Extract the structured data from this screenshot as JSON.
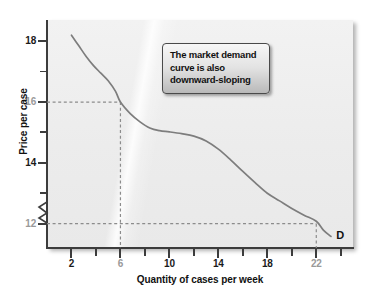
{
  "chart_data": {
    "type": "line",
    "title": "",
    "xlabel": "Quantity of cases per week",
    "ylabel": "Price per case",
    "xlim": [
      0,
      25
    ],
    "ylim": [
      11.2,
      18.7
    ],
    "grid": false,
    "legend": "none",
    "y_axis_break": true,
    "series": [
      {
        "name": "D",
        "label": "D",
        "color": "#7d7d7d",
        "x": [
          2.0,
          2.6,
          3.2,
          3.8,
          4.4,
          5.0,
          5.6,
          6.0,
          6.8,
          7.6,
          8.4,
          9.2,
          10.0,
          11.0,
          12.0,
          13.0,
          14.0,
          15.0,
          16.0,
          17.0,
          18.0,
          19.0,
          20.0,
          21.0,
          22.0,
          22.6,
          23.2
        ],
        "y": [
          18.2,
          17.85,
          17.5,
          17.2,
          16.95,
          16.7,
          16.35,
          16.0,
          15.62,
          15.35,
          15.15,
          15.06,
          15.02,
          14.96,
          14.88,
          14.72,
          14.45,
          14.1,
          13.72,
          13.35,
          13.0,
          12.75,
          12.5,
          12.28,
          12.08,
          11.78,
          11.58
        ]
      }
    ],
    "x_ticks_major": [
      2,
      6,
      10,
      14,
      18,
      22
    ],
    "x_ticks_minor": [
      4,
      8,
      12,
      16,
      20,
      24
    ],
    "x_tick_labels": [
      {
        "value": 2,
        "text": "2",
        "muted": false
      },
      {
        "value": 6,
        "text": "6",
        "muted": true
      },
      {
        "value": 10,
        "text": "10",
        "muted": false
      },
      {
        "value": 14,
        "text": "14",
        "muted": false
      },
      {
        "value": 18,
        "text": "18",
        "muted": false
      },
      {
        "value": 22,
        "text": "22",
        "muted": true
      }
    ],
    "y_ticks_major": [
      12,
      13,
      14,
      15,
      16,
      17,
      18
    ],
    "y_tick_labels": [
      {
        "value": 18,
        "text": "18",
        "muted": false
      },
      {
        "value": 16,
        "text": "16",
        "muted": true
      },
      {
        "value": 14,
        "text": "14",
        "muted": false
      },
      {
        "value": 12,
        "text": "12",
        "muted": true
      }
    ],
    "guide_lines": [
      {
        "name": "guide-6-16",
        "x": 6,
        "y": 16,
        "style": "dashed",
        "color": "#8c8c8c"
      },
      {
        "name": "guide-22-12",
        "x": 22,
        "y": 12,
        "style": "dashed",
        "color": "#8c8c8c"
      }
    ],
    "annotations": [
      {
        "name": "market-demand-callout",
        "lines": [
          "The market demand",
          "curve is also",
          "downward-sloping"
        ]
      },
      {
        "name": "curve-label",
        "text": "D",
        "x": 23.8,
        "y": 11.6
      }
    ]
  },
  "colors": {
    "panel_background": "#eeeeee",
    "axis": "#3c3c3c",
    "curve": "#7d7d7d",
    "guide": "#8c8c8c",
    "label": "#1a1a1a",
    "label_muted": "#9a9a9a"
  }
}
